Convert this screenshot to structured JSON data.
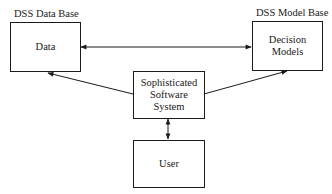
{
  "diagram": {
    "labels": {
      "data_base": "DSS Data Base",
      "model_base": "DSS Model Base"
    },
    "nodes": {
      "data": "Data",
      "models": "Decision\nModels",
      "software": "Sophisticated\nSoftware\nSystem",
      "user": "User"
    },
    "edges": [
      {
        "from": "data",
        "to": "models",
        "type": "bidirectional"
      },
      {
        "from": "software",
        "to": "data",
        "type": "directed"
      },
      {
        "from": "software",
        "to": "models",
        "type": "directed"
      },
      {
        "from": "software",
        "to": "user",
        "type": "bidirectional"
      }
    ]
  }
}
